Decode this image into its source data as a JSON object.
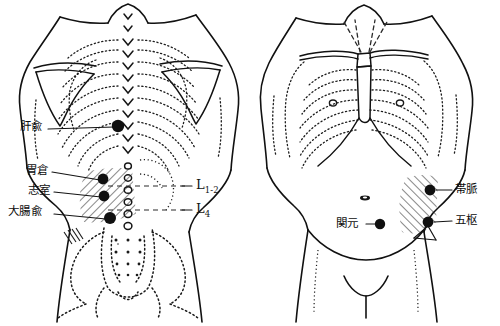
{
  "diagram": {
    "background_color": "#ffffff",
    "ink_color": "#111111",
    "point_color": "#101010",
    "views": [
      {
        "name": "posterior-view",
        "side": "back",
        "labels": [
          {
            "id": "ganshu",
            "text": "肝兪",
            "x": 20,
            "y": 124,
            "point_x": 118,
            "point_y": 126
          },
          {
            "id": "weicang",
            "text": "胃倉",
            "x": 26,
            "y": 168,
            "point_x": 103,
            "point_y": 179
          },
          {
            "id": "zhishi",
            "text": "志室",
            "x": 28,
            "y": 188,
            "point_x": 104,
            "point_y": 196
          },
          {
            "id": "dachangshu",
            "text": "大腸兪",
            "x": 10,
            "y": 209,
            "point_x": 110,
            "point_y": 218
          }
        ],
        "vertebra_labels": [
          {
            "id": "l1-2",
            "base": "L",
            "sub": "1-2",
            "x": 196,
            "y": 181
          },
          {
            "id": "l4",
            "base": "L",
            "sub": "4",
            "x": 196,
            "y": 205
          }
        ]
      },
      {
        "name": "anterior-view",
        "side": "front",
        "labels": [
          {
            "id": "guanyuan",
            "text": "関元",
            "x": 336,
            "y": 218,
            "point_x": 380,
            "point_y": 224
          },
          {
            "id": "daimai",
            "text": "帯脈",
            "x": 455,
            "y": 185,
            "point_x": 430,
            "point_y": 190
          },
          {
            "id": "wushu",
            "text": "五枢",
            "x": 455,
            "y": 216,
            "point_x": 428,
            "point_y": 222
          }
        ]
      }
    ]
  }
}
